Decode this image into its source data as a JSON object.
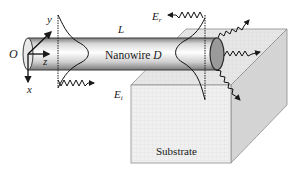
{
  "diagram": {
    "labels": {
      "origin": "O",
      "axis_y": "y",
      "axis_z": "z",
      "axis_x": "x",
      "length": "L",
      "nanowire": "Nanowire",
      "diameter": "D",
      "incident_field": "E",
      "incident_sub": "i",
      "reflected_field": "E",
      "reflected_sub": "r",
      "substrate": "Substrate"
    },
    "colors": {
      "line": "#1a1a1a",
      "wire_light": "#f4f4f4",
      "wire_dark": "#8a8a8a",
      "end_cap": "#9a9a9a",
      "substrate_front": "#efefef",
      "substrate_top": "#e4e4e4",
      "substrate_side": "#d2d2d2"
    }
  }
}
